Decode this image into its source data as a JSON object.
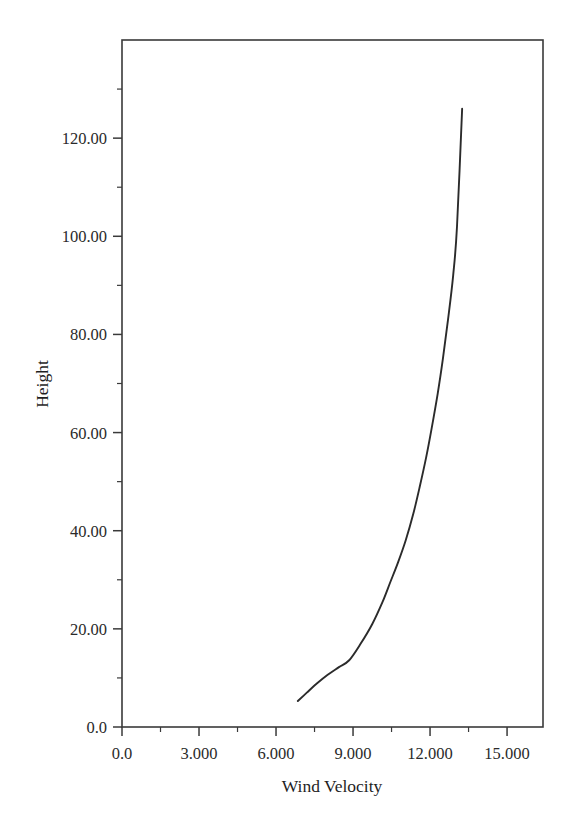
{
  "chart_data": {
    "type": "line",
    "title": "",
    "xlabel": "Wind Velocity",
    "ylabel": "Height",
    "xlim": [
      0.0,
      16.4
    ],
    "ylim": [
      0.0,
      140.0
    ],
    "grid": false,
    "legend": null,
    "xticks": [
      {
        "value": 0.0,
        "label": "0.0"
      },
      {
        "value": 3.0,
        "label": "3.000"
      },
      {
        "value": 6.0,
        "label": "6.000"
      },
      {
        "value": 9.0,
        "label": "9.000"
      },
      {
        "value": 12.0,
        "label": "12.000"
      },
      {
        "value": 15.0,
        "label": "15.000"
      }
    ],
    "x_minor_ticks": [
      1.5,
      4.5,
      7.5,
      10.5,
      13.5,
      16.5
    ],
    "yticks": [
      {
        "value": 0.0,
        "label": "0.0"
      },
      {
        "value": 20.0,
        "label": "20.00"
      },
      {
        "value": 40.0,
        "label": "40.00"
      },
      {
        "value": 60.0,
        "label": "60.00"
      },
      {
        "value": 80.0,
        "label": "80.00"
      },
      {
        "value": 100.0,
        "label": "100.00"
      },
      {
        "value": 120.0,
        "label": "120.00"
      }
    ],
    "y_minor_ticks": [
      10,
      30,
      50,
      70,
      90,
      110,
      130
    ],
    "series": [
      {
        "name": "wind profile",
        "color": "#2b2b2b",
        "x": [
          6.85,
          7.2,
          7.6,
          8.0,
          8.45,
          8.85,
          9.3,
          9.75,
          10.15,
          10.45,
          10.75,
          11.05,
          11.35,
          11.6,
          11.85,
          12.05,
          12.3,
          12.5,
          12.7,
          12.9,
          13.05,
          13.25
        ],
        "y": [
          5.3,
          7.0,
          8.9,
          10.6,
          12.2,
          13.6,
          17.0,
          21.0,
          25.5,
          29.5,
          33.5,
          38.0,
          43.5,
          49.0,
          55.0,
          60.5,
          68.0,
          75.0,
          83.0,
          92.0,
          102.0,
          126.0
        ]
      }
    ]
  },
  "axis_titles": {
    "x": "Wind Velocity",
    "y": "Height"
  }
}
